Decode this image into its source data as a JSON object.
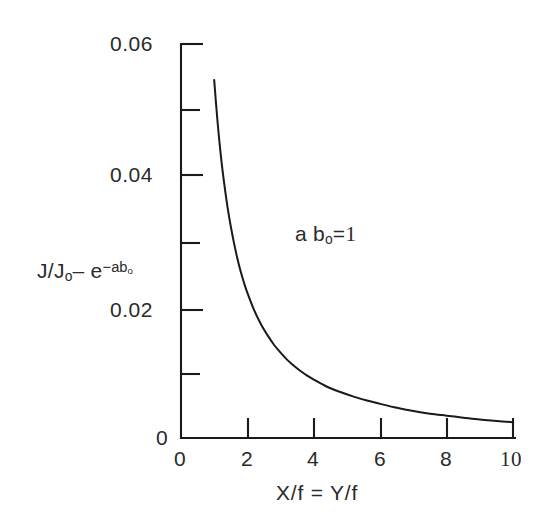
{
  "chart_data": {
    "type": "line",
    "title": "",
    "subtitle": "",
    "xlabel": "X/f = Y/f",
    "ylabel": "J/J₀ − e⁻ᵃᵇ₀",
    "ylabel_parts": {
      "lead": "J/J",
      "lead_sub": "o",
      "minus": "– e",
      "exp_minus": "−",
      "exp_base": "ab",
      "exp_sub": "o"
    },
    "xlim": [
      0,
      10
    ],
    "ylim": [
      0,
      0.06
    ],
    "grid": false,
    "legend": null,
    "legend_position": "none",
    "x_ticks": [
      0,
      2,
      4,
      6,
      8,
      10
    ],
    "x_tick_labels": [
      "0",
      "2",
      "4",
      "6",
      "8",
      "10"
    ],
    "x_minor_ticks": [],
    "y_ticks": [
      0,
      0.02,
      0.04,
      0.06
    ],
    "y_tick_labels": [
      "0",
      "0.02",
      "0.04",
      "0.06"
    ],
    "y_minor_ticks": [
      0.01,
      0.03,
      0.05
    ],
    "annotations": [
      {
        "text": "a b₀ = 1",
        "parts": {
          "a": "a b",
          "sub": "o",
          "eq": "=",
          "value": "1"
        },
        "x": 5.0,
        "y": 0.0355
      }
    ],
    "series": [
      {
        "name": "J/Jo minus exp(-ab_o)",
        "x": [
          1.0,
          1.1,
          1.2,
          1.3,
          1.4,
          1.5,
          1.6,
          1.7,
          1.8,
          1.9,
          2.0,
          2.2,
          2.4,
          2.6,
          2.8,
          3.0,
          3.2,
          3.4,
          3.6,
          3.8,
          4.0,
          4.4,
          4.8,
          5.2,
          5.6,
          6.0,
          6.5,
          7.0,
          7.5,
          8.0,
          8.5,
          9.0,
          9.5,
          10.0
        ],
        "y": [
          0.0545,
          0.0482,
          0.043,
          0.0388,
          0.0352,
          0.0322,
          0.0296,
          0.0273,
          0.0253,
          0.0236,
          0.0221,
          0.0195,
          0.0174,
          0.0157,
          0.0142,
          0.013,
          0.0119,
          0.011,
          0.0102,
          0.0095,
          0.0089,
          0.0078,
          0.007,
          0.0063,
          0.0057,
          0.0052,
          0.0046,
          0.0041,
          0.0037,
          0.0034,
          0.0031,
          0.0028,
          0.0026,
          0.0024
        ]
      }
    ],
    "curve_start": {
      "x": 1.0,
      "y": 0.0545
    },
    "curve_end": {
      "x": 10.0,
      "y": 0.0024
    }
  },
  "axes": {
    "x_title": "X/f  =  Y/f",
    "y_tick_0": "0",
    "y_tick_1": "0.02",
    "y_tick_2": "0.04",
    "y_tick_3": "0.06",
    "x_tick_0": "0",
    "x_tick_1": "2",
    "x_tick_2": "4",
    "x_tick_3": "6",
    "x_tick_4": "8",
    "x_tick_5": "10"
  },
  "colors": {
    "background": "#ffffff",
    "ink": "#1a1a1a",
    "text": "#2a2a2a"
  }
}
